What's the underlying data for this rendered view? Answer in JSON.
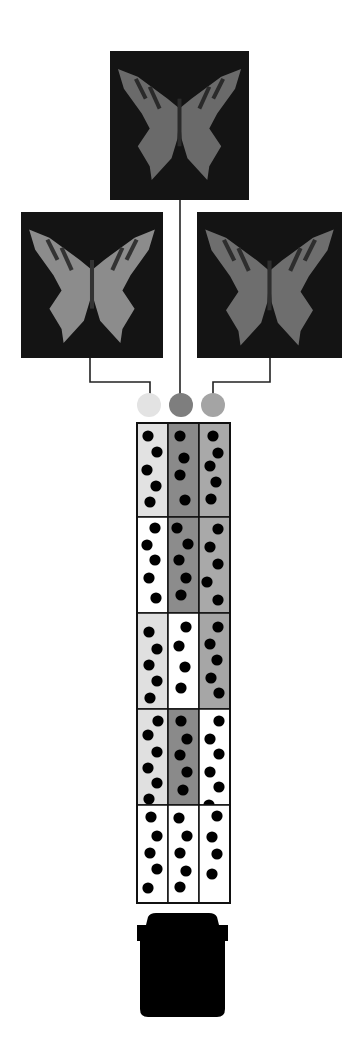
{
  "figure": {
    "colors": {
      "background": "#ffffff",
      "panel": "#141414",
      "line": "#222222",
      "dot": "#000000",
      "circle_left": "#e3e3e3",
      "circle_center": "#7e7e7e",
      "circle_right": "#a4a4a4",
      "container": "#000000"
    },
    "images": [
      {
        "id": "top",
        "x": 110,
        "y": 51,
        "w": 139,
        "h": 149,
        "wing": "#6a6a6a",
        "stripes": "#2a2a2a",
        "label": "butterfly-top"
      },
      {
        "id": "left",
        "x": 21,
        "y": 212,
        "w": 142,
        "h": 146,
        "wing": "#8c8c8c",
        "stripes": "#333333",
        "label": "butterfly-left"
      },
      {
        "id": "right",
        "x": 197,
        "y": 212,
        "w": 145,
        "h": 146,
        "wing": "#6e6e6e",
        "stripes": "#2e2e2e",
        "label": "butterfly-right"
      }
    ],
    "circles": [
      {
        "cx": 149,
        "cy": 405,
        "r": 12,
        "fill": "#e3e3e3"
      },
      {
        "cx": 181,
        "cy": 405,
        "r": 12,
        "fill": "#7e7e7e"
      },
      {
        "cx": 213,
        "cy": 405,
        "r": 12,
        "fill": "#a4a4a4"
      }
    ],
    "grid": {
      "x": 137,
      "y": 423,
      "col_w": 31,
      "row_ys": [
        423,
        517,
        613,
        709,
        805,
        903
      ],
      "rows": [
        {
          "fills": [
            "#e2e2e2",
            "#8a8a8a",
            "#a9a9a9"
          ],
          "dots": [
            [
              [
                148,
                436
              ],
              [
                157,
                452
              ],
              [
                147,
                470
              ],
              [
                156,
                486
              ],
              [
                150,
                502
              ]
            ],
            [
              [
                180,
                436
              ],
              [
                184,
                458
              ],
              [
                180,
                475
              ],
              [
                185,
                500
              ]
            ],
            [
              [
                213,
                436
              ],
              [
                218,
                453
              ],
              [
                210,
                466
              ],
              [
                216,
                482
              ],
              [
                211,
                499
              ]
            ]
          ]
        },
        {
          "fills": [
            "#ffffff",
            "#8c8c8c",
            "#a9a9a9"
          ],
          "dots": [
            [
              [
                155,
                528
              ],
              [
                147,
                545
              ],
              [
                155,
                560
              ],
              [
                149,
                578
              ],
              [
                156,
                598
              ]
            ],
            [
              [
                177,
                528
              ],
              [
                188,
                544
              ],
              [
                179,
                560
              ],
              [
                186,
                578
              ],
              [
                181,
                595
              ]
            ],
            [
              [
                218,
                529
              ],
              [
                210,
                547
              ],
              [
                218,
                564
              ],
              [
                207,
                582
              ],
              [
                218,
                600
              ]
            ]
          ]
        },
        {
          "fills": [
            "#e0e0e0",
            "#ffffff",
            "#a6a6a6"
          ],
          "dots": [
            [
              [
                149,
                632
              ],
              [
                157,
                649
              ],
              [
                149,
                665
              ],
              [
                157,
                681
              ],
              [
                150,
                698
              ]
            ],
            [
              [
                186,
                627
              ],
              [
                179,
                646
              ],
              [
                185,
                667
              ],
              [
                181,
                688
              ]
            ],
            [
              [
                218,
                627
              ],
              [
                210,
                644
              ],
              [
                217,
                660
              ],
              [
                211,
                678
              ],
              [
                219,
                693
              ]
            ]
          ]
        },
        {
          "fills": [
            "#e0e0e0",
            "#8a8a8a",
            "#ffffff"
          ],
          "dots": [
            [
              [
                158,
                721
              ],
              [
                148,
                735
              ],
              [
                157,
                752
              ],
              [
                148,
                768
              ],
              [
                157,
                783
              ],
              [
                149,
                799
              ]
            ],
            [
              [
                181,
                721
              ],
              [
                187,
                739
              ],
              [
                180,
                755
              ],
              [
                187,
                772
              ],
              [
                183,
                790
              ]
            ],
            [
              [
                219,
                721
              ],
              [
                210,
                739
              ],
              [
                219,
                754
              ],
              [
                210,
                772
              ],
              [
                219,
                787
              ],
              [
                209,
                805
              ]
            ]
          ]
        },
        {
          "fills": [
            "#ffffff",
            "#ffffff",
            "#ffffff"
          ],
          "dots": [
            [
              [
                151,
                817
              ],
              [
                157,
                836
              ],
              [
                150,
                853
              ],
              [
                157,
                869
              ],
              [
                148,
                888
              ]
            ],
            [
              [
                179,
                818
              ],
              [
                187,
                836
              ],
              [
                180,
                853
              ],
              [
                186,
                871
              ],
              [
                180,
                887
              ]
            ],
            [
              [
                217,
                816
              ],
              [
                212,
                837
              ],
              [
                217,
                854
              ],
              [
                212,
                874
              ]
            ]
          ]
        }
      ]
    },
    "container": {
      "x": 134,
      "y": 913,
      "w": 97,
      "h": 104,
      "fill": "#000000"
    }
  }
}
